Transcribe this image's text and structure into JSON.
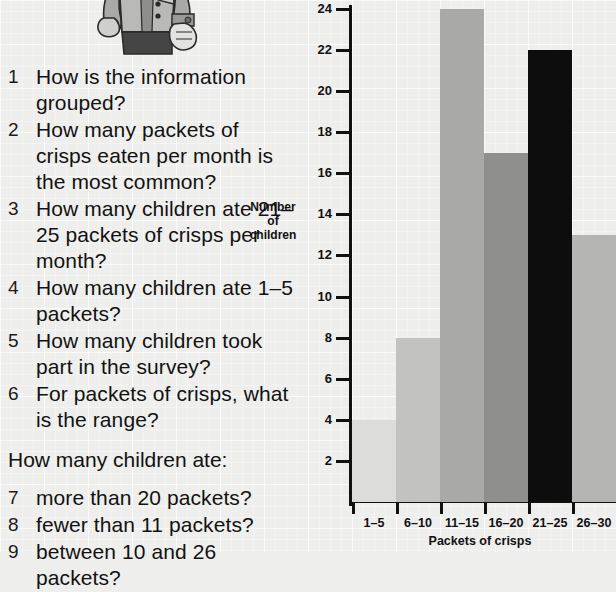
{
  "illustration": {
    "name": "boy-character-illustration",
    "alt": "cartoon boy in waistcoat with clenched fists"
  },
  "questions": [
    {
      "num": "1",
      "text": "How is the information grouped?"
    },
    {
      "num": "2",
      "text": "How many packets of crisps eaten per month is the most common?"
    },
    {
      "num": "3",
      "text": "How many children ate 21–25 packets of crisps per month?"
    },
    {
      "num": "4",
      "text": "How many children ate 1–5 packets?"
    },
    {
      "num": "5",
      "text": "How many children took part in the survey?"
    },
    {
      "num": "6",
      "text": "For packets of crisps, what is the range?"
    }
  ],
  "prompt": "How many children ate:",
  "questions2": [
    {
      "num": "7",
      "text": "more than 20 packets?"
    },
    {
      "num": "8",
      "text": "fewer than 11 packets?"
    },
    {
      "num": "9",
      "text": "between 10 and 26 packets?"
    }
  ],
  "chart_data": {
    "type": "bar",
    "title": "",
    "xlabel": "Packets of crisps",
    "ylabel": "Number of children",
    "ylabel_lines": [
      "Number",
      "of",
      "children"
    ],
    "categories": [
      "1–5",
      "6–10",
      "11–15",
      "16–20",
      "21–25",
      "26–30"
    ],
    "values": [
      4,
      8,
      24,
      17,
      22,
      13
    ],
    "bar_colors": [
      "#dcdcda",
      "#c2c2c0",
      "#a9a9a7",
      "#8f8f8d",
      "#0d0d0d",
      "#b5b5b3"
    ],
    "ylim": [
      0,
      24
    ],
    "yticks": [
      2,
      4,
      6,
      8,
      10,
      12,
      14,
      16,
      18,
      20,
      22,
      24
    ],
    "ytick_labels": [
      "2",
      "4",
      "6",
      "8",
      "10",
      "12",
      "14",
      "16",
      "18",
      "20",
      "22",
      "24"
    ],
    "grid": true,
    "legend": "none"
  },
  "colors": {
    "page_background": "#eeeeec",
    "grid_line": "#ffffff",
    "axis": "#111111",
    "text": "#121212"
  }
}
